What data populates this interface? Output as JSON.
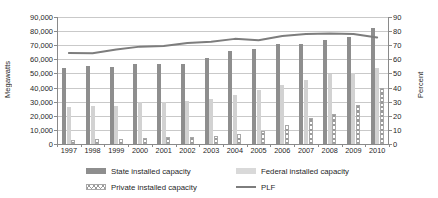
{
  "chart_data": {
    "type": "bar",
    "title": "",
    "xlabel": "",
    "ylabel": "Megawatts",
    "y2label": "Percent",
    "categories": [
      "1997",
      "1998",
      "1999",
      "2000",
      "2001",
      "2002",
      "2003",
      "2004",
      "2005",
      "2006",
      "2007",
      "2008",
      "2009",
      "2010"
    ],
    "ylim": [
      0,
      90000
    ],
    "yticks": [
      "0",
      "10,000",
      "20,000",
      "30,000",
      "40,000",
      "50,000",
      "60,000",
      "70,000",
      "80,000",
      "90,000"
    ],
    "ytick_values": [
      0,
      10000,
      20000,
      30000,
      40000,
      50000,
      60000,
      70000,
      80000,
      90000
    ],
    "y2lim": [
      0,
      90
    ],
    "y2ticks": [
      "0",
      "10",
      "20",
      "30",
      "40",
      "50",
      "60",
      "70",
      "80",
      "90"
    ],
    "y2tick_values": [
      0,
      10,
      20,
      30,
      40,
      50,
      60,
      70,
      80,
      90
    ],
    "grid": true,
    "legend_position": "bottom",
    "series": [
      {
        "name": "State installed capacity",
        "axis": "left",
        "kind": "bar",
        "color": "#8e8e8e",
        "values": [
          54000,
          55200,
          54500,
          56600,
          56800,
          57000,
          61000,
          65800,
          67200,
          70800,
          71000,
          74000,
          76000,
          82200
        ]
      },
      {
        "name": "Federal installed capacity",
        "axis": "left",
        "kind": "bar",
        "color": "#d2d2d2",
        "values": [
          26500,
          27000,
          26700,
          30000,
          29800,
          30500,
          32000,
          34500,
          38000,
          41500,
          45500,
          49500,
          50000,
          54000
        ]
      },
      {
        "name": "Private installed capacity",
        "axis": "left",
        "kind": "bar",
        "color": "#ffffff",
        "pattern": "cross-hatch",
        "values": [
          3000,
          3300,
          3500,
          4500,
          5000,
          5300,
          6000,
          7200,
          9000,
          13500,
          18500,
          21000,
          28000,
          40000
        ]
      },
      {
        "name": "PLF",
        "axis": "right",
        "kind": "line",
        "color": "#7d7d7d",
        "values": [
          64.5,
          64.3,
          67.0,
          69.0,
          69.5,
          71.5,
          72.5,
          74.5,
          73.5,
          76.5,
          78.0,
          78.3,
          78.0,
          75.5
        ]
      }
    ]
  },
  "legend": {
    "items": [
      {
        "label": "State installed capacity",
        "icon": "bar-swatch-dark"
      },
      {
        "label": "Federal installed capacity",
        "icon": "bar-swatch-light"
      },
      {
        "label": "Private installed capacity",
        "icon": "bar-swatch-hatched"
      },
      {
        "label": "PLF",
        "icon": "line-swatch"
      }
    ]
  }
}
